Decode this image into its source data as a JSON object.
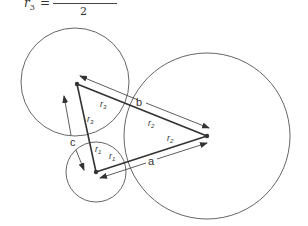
{
  "formula": {
    "lhs_var": "r",
    "lhs_sub": "3",
    "equals": "=",
    "denominator": "2"
  },
  "diagram": {
    "circles": [
      {
        "name": "circle-3",
        "cx": 75,
        "cy": 82,
        "r": 54
      },
      {
        "name": "circle-2",
        "cx": 207,
        "cy": 136,
        "r": 83
      },
      {
        "name": "circle-1",
        "cx": 96,
        "cy": 172,
        "r": 30
      }
    ],
    "labels": {
      "a": "a",
      "b": "b",
      "c": "c",
      "r1": "r",
      "r1_sub": "1",
      "r2": "r",
      "r2_sub": "2",
      "r3": "r",
      "r3_sub": "3"
    },
    "colors": {
      "stroke": "#555555",
      "line": "#333333"
    }
  }
}
